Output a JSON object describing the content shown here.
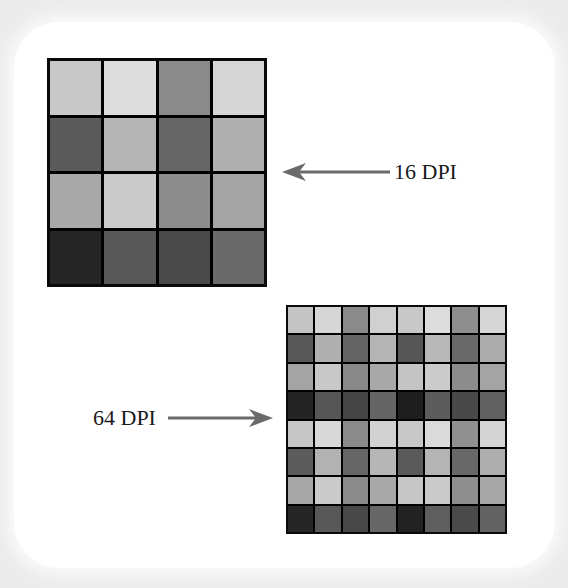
{
  "diagram": {
    "labels": {
      "low_res": "16 DPI",
      "high_res": "64 DPI"
    },
    "colors": {
      "background": "#ebebeb",
      "card": "#ffffff",
      "grid_lines": "#0a0a0a",
      "arrow": "#6a6a6a",
      "text": "#1a1a1a"
    },
    "grid_16dpi": {
      "rows": 4,
      "cols": 4,
      "cells": [
        [
          "#c8c8c8",
          "#dcdcdc",
          "#8a8a8a",
          "#d6d6d6"
        ],
        [
          "#5a5a5a",
          "#b4b4b4",
          "#666666",
          "#b0b0b0"
        ],
        [
          "#a8a8a8",
          "#cacaca",
          "#8c8c8c",
          "#a4a4a4"
        ],
        [
          "#262626",
          "#585858",
          "#4a4a4a",
          "#6a6a6a"
        ]
      ]
    },
    "grid_64dpi": {
      "rows": 8,
      "cols": 8,
      "cells": [
        [
          "#c4c4c4",
          "#d6d6d6",
          "#8a8a8a",
          "#d0d0d0",
          "#c8c8c8",
          "#dcdcdc",
          "#8e8e8e",
          "#d6d6d6"
        ],
        [
          "#585858",
          "#b0b0b0",
          "#646464",
          "#b4b4b4",
          "#565656",
          "#b8b8b8",
          "#6a6a6a",
          "#acacac"
        ],
        [
          "#a4a4a4",
          "#c8c8c8",
          "#888888",
          "#a8a8a8",
          "#c4c4c4",
          "#cccccc",
          "#8c8c8c",
          "#a4a4a4"
        ],
        [
          "#242424",
          "#565656",
          "#444444",
          "#646464",
          "#1e1e1e",
          "#5c5c5c",
          "#484848",
          "#606060"
        ],
        [
          "#c6c6c6",
          "#d8d8d8",
          "#8a8a8a",
          "#d2d2d2",
          "#c8c8c8",
          "#dadada",
          "#909090",
          "#d4d4d4"
        ],
        [
          "#5c5c5c",
          "#b2b2b2",
          "#666666",
          "#b6b6b6",
          "#5a5a5a",
          "#b4b4b4",
          "#686868",
          "#aeaeae"
        ],
        [
          "#a6a6a6",
          "#cacaca",
          "#8a8a8a",
          "#a8a8a8",
          "#c6c6c6",
          "#cacaca",
          "#8e8e8e",
          "#a6a6a6"
        ],
        [
          "#262626",
          "#585858",
          "#484848",
          "#666666",
          "#222222",
          "#5e5e5e",
          "#4a4a4a",
          "#626262"
        ]
      ]
    }
  }
}
